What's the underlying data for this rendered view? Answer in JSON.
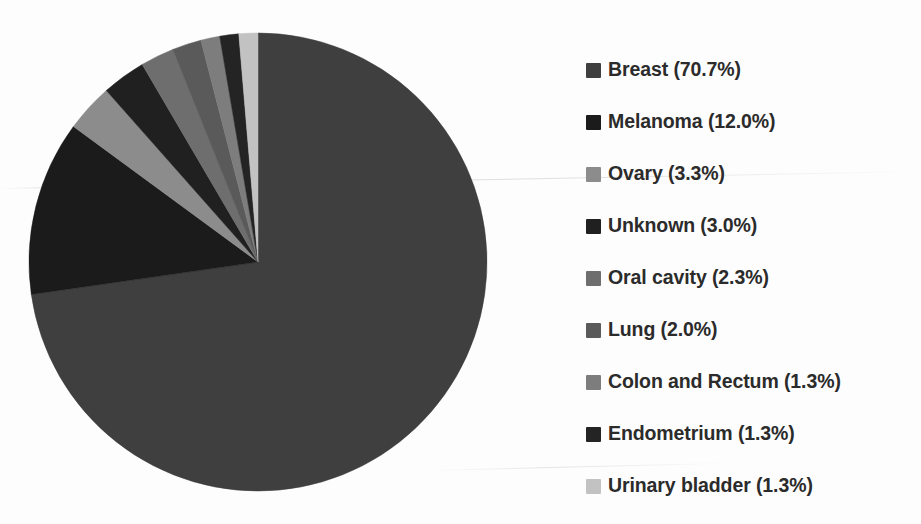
{
  "chart_data": {
    "type": "pie",
    "title": "",
    "subtitle": "",
    "xlabel": "",
    "ylabel": "",
    "legend_position": "right",
    "grid": false,
    "units": "percent",
    "start_angle_deg": 0,
    "direction": "clockwise",
    "categories": [
      "Breast",
      "Melanoma",
      "Ovary",
      "Unknown",
      "Oral cavity",
      "Lung",
      "Colon and Rectum",
      "Endometrium",
      "Urinary bladder"
    ],
    "values": [
      70.7,
      12.0,
      3.3,
      3.0,
      2.3,
      2.0,
      1.3,
      1.3,
      1.3
    ],
    "value_labels": [
      "70.7%",
      "12.0%",
      "3.3%",
      "3.0%",
      "2.3%",
      "2.0%",
      "1.3%",
      "1.3%",
      "1.3%"
    ],
    "colors": [
      "#3f3f3f",
      "#1b1b1b",
      "#8c8c8c",
      "#202020",
      "#6e6e6e",
      "#5a5a5a",
      "#7d7d7d",
      "#242424",
      "#c2c2c2"
    ],
    "slices": [
      {
        "label": "Breast",
        "value": 70.7,
        "value_label": "70.7%",
        "color": "#3f3f3f"
      },
      {
        "label": "Melanoma",
        "value": 12.0,
        "value_label": "12.0%",
        "color": "#1b1b1b"
      },
      {
        "label": "Ovary",
        "value": 3.3,
        "value_label": "3.3%",
        "color": "#8c8c8c"
      },
      {
        "label": "Unknown",
        "value": 3.0,
        "value_label": "3.0%",
        "color": "#202020"
      },
      {
        "label": "Oral cavity",
        "value": 2.3,
        "value_label": "2.3%",
        "color": "#6e6e6e"
      },
      {
        "label": "Lung",
        "value": 2.0,
        "value_label": "2.0%",
        "color": "#5a5a5a"
      },
      {
        "label": "Colon and Rectum",
        "value": 1.3,
        "value_label": "1.3%",
        "color": "#7d7d7d"
      },
      {
        "label": "Endometrium",
        "value": 1.3,
        "value_label": "1.3%",
        "color": "#242424"
      },
      {
        "label": "Urinary bladder",
        "value": 1.3,
        "value_label": "1.3%",
        "color": "#c2c2c2"
      }
    ]
  },
  "legend": {
    "entries": [
      {
        "text": "Breast (70.7%)",
        "color": "#3f3f3f"
      },
      {
        "text": "Melanoma (12.0%)",
        "color": "#1b1b1b"
      },
      {
        "text": "Ovary (3.3%)",
        "color": "#8c8c8c"
      },
      {
        "text": "Unknown (3.0%)",
        "color": "#202020"
      },
      {
        "text": "Oral cavity (2.3%)",
        "color": "#6e6e6e"
      },
      {
        "text": "Lung (2.0%)",
        "color": "#5a5a5a"
      },
      {
        "text": "Colon and Rectum (1.3%)",
        "color": "#7d7d7d"
      },
      {
        "text": "Endometrium (1.3%)",
        "color": "#242424"
      },
      {
        "text": "Urinary bladder (1.3%)",
        "color": "#c2c2c2"
      }
    ]
  },
  "geometry": {
    "center_x": 236,
    "center_y": 240,
    "radius": 229
  }
}
